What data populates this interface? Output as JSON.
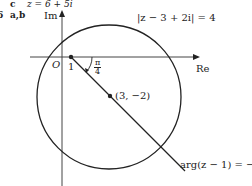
{
  "header": {
    "part_c_label": "c",
    "part_c_text": "z = 6 + 5i",
    "part_ab_number": "6",
    "part_ab_label": "a,b"
  },
  "axes": {
    "imag_label": "Im",
    "real_label": "Re",
    "origin_label": "O"
  },
  "labels": {
    "tick_one": "1",
    "angle_num": "π",
    "angle_den": "4",
    "center_point": "(3, −2)",
    "circle_equation": "|z − 3 + 2i| = 4",
    "ray_equation_prefix": "arg(z − 1) = −",
    "ray_num": "π",
    "ray_den": "4"
  },
  "diagram": {
    "circle": {
      "center": [
        3,
        -2
      ],
      "radius": 4
    },
    "ray": {
      "start": [
        1,
        0
      ],
      "angle": "-π/4"
    },
    "stroke_color": "#222222"
  }
}
